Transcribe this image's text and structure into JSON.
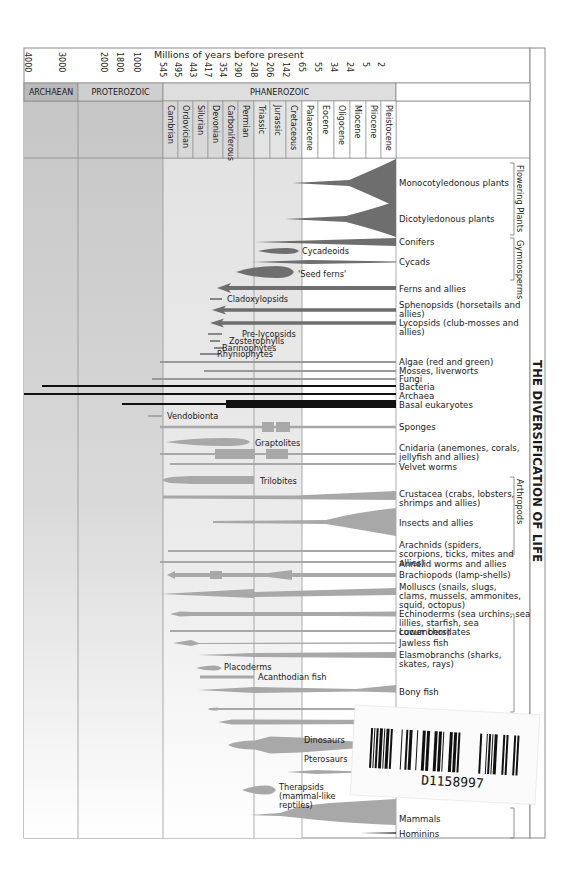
{
  "title": "THE DIVERSIFICATION OF LIFE",
  "axis": {
    "label": "Millions of years before present",
    "ticks": [
      {
        "label": "4000",
        "x": 28
      },
      {
        "label": "3000",
        "x": 62
      },
      {
        "label": "2000",
        "x": 104
      },
      {
        "label": "1800",
        "x": 120
      },
      {
        "label": "1000",
        "x": 137
      },
      {
        "label": "545",
        "x": 163
      },
      {
        "label": "495",
        "x": 178
      },
      {
        "label": "443",
        "x": 193
      },
      {
        "label": "417",
        "x": 208
      },
      {
        "label": "354",
        "x": 223
      },
      {
        "label": "290",
        "x": 238
      },
      {
        "label": "248",
        "x": 254
      },
      {
        "label": "206",
        "x": 270
      },
      {
        "label": "142",
        "x": 286
      },
      {
        "label": "65",
        "x": 302
      },
      {
        "label": "55",
        "x": 318
      },
      {
        "label": "34",
        "x": 334
      },
      {
        "label": "24",
        "x": 350
      },
      {
        "label": "5",
        "x": 366
      },
      {
        "label": "2",
        "x": 381
      }
    ]
  },
  "eras": [
    {
      "label": "ARCHAEAN",
      "x0": 24,
      "x1": 78,
      "fill": "#b9b9b9"
    },
    {
      "label": "PROTEROZOIC",
      "x0": 78,
      "x1": 163,
      "fill": "#cfcfcf"
    },
    {
      "label": "PHANEROZOIC",
      "x0": 163,
      "x1": 396,
      "fill": "#dedede"
    }
  ],
  "periods": [
    {
      "label": "Cambrian",
      "x0": 163,
      "x1": 178,
      "fill": "#d8d8d8"
    },
    {
      "label": "Ordovician",
      "x0": 178,
      "x1": 193,
      "fill": "#d8d8d8"
    },
    {
      "label": "Silurian",
      "x0": 193,
      "x1": 208,
      "fill": "#d8d8d8"
    },
    {
      "label": "Devonian",
      "x0": 208,
      "x1": 223,
      "fill": "#d8d8d8"
    },
    {
      "label": "Carboniferous",
      "x0": 223,
      "x1": 238,
      "fill": "#d8d8d8"
    },
    {
      "label": "Permian",
      "x0": 238,
      "x1": 254,
      "fill": "#d8d8d8"
    },
    {
      "label": "Triassic",
      "x0": 254,
      "x1": 270,
      "fill": "#e4e4e4"
    },
    {
      "label": "Jurassic",
      "x0": 270,
      "x1": 286,
      "fill": "#e4e4e4"
    },
    {
      "label": "Cretaceous",
      "x0": 286,
      "x1": 302,
      "fill": "#e4e4e4"
    },
    {
      "label": "Palaeocene",
      "x0": 302,
      "x1": 318,
      "fill": "#ffffff"
    },
    {
      "label": "Eocene",
      "x0": 318,
      "x1": 334,
      "fill": "#ffffff"
    },
    {
      "label": "Oligocene",
      "x0": 334,
      "x1": 350,
      "fill": "#ffffff"
    },
    {
      "label": "Miocene",
      "x0": 350,
      "x1": 366,
      "fill": "#ffffff"
    },
    {
      "label": "Pliocene",
      "x0": 366,
      "x1": 381,
      "fill": "#ffffff"
    },
    {
      "label": "Pleistocene",
      "x0": 381,
      "x1": 396,
      "fill": "#ffffff"
    }
  ],
  "groups": [
    {
      "label": "Flowering Plants",
      "y0": 163,
      "y1": 235
    },
    {
      "label": "Gymnosperms",
      "y0": 238,
      "y1": 280
    },
    {
      "label": "Arthropods",
      "y0": 477,
      "y1": 555
    },
    {
      "label": "",
      "y0": 614,
      "y1": 712
    },
    {
      "label": "",
      "y0": 808,
      "y1": 838
    }
  ],
  "lineages": [
    {
      "label": "Monocotyledonous plants",
      "ly": 183,
      "color": "#6e6e6e",
      "shape": "flare",
      "x0": 292,
      "x1": 396,
      "y": 183,
      "w": 48
    },
    {
      "label": "Dicotyledonous plants",
      "ly": 219,
      "color": "#6e6e6e",
      "shape": "flare",
      "x0": 285,
      "x1": 396,
      "y": 219,
      "w": 36
    },
    {
      "label": "Conifers",
      "ly": 242,
      "color": "#6e6e6e",
      "shape": "wedge",
      "x0": 255,
      "x1": 396,
      "y": 242,
      "w": 8
    },
    {
      "label": "Cycadeoids",
      "ly": 251,
      "color": "#6e6e6e",
      "shape": "spindle",
      "x0": 258,
      "x1": 299,
      "y": 251,
      "w": 6,
      "inline": true
    },
    {
      "label": "Cycads",
      "ly": 262,
      "color": "#6e6e6e",
      "shape": "taper",
      "x0": 252,
      "x1": 396,
      "y": 262,
      "w": 4
    },
    {
      "label": "'Seed ferns'",
      "ly": 274,
      "color": "#6e6e6e",
      "shape": "spindle",
      "x0": 236,
      "x1": 294,
      "y": 272,
      "w": 12,
      "inline": true
    },
    {
      "label": "Ferns and allies",
      "ly": 289,
      "color": "#6e6e6e",
      "shape": "arrowbar",
      "x0": 217,
      "x1": 396,
      "y": 288,
      "w": 8
    },
    {
      "label": "Cladoxylopsids",
      "ly": 299,
      "color": "#888888",
      "shape": "bar",
      "x0": 210,
      "x1": 222,
      "y": 299,
      "w": 2,
      "inline": true
    },
    {
      "label": "Sphenopsids (horsetails and allies)",
      "ly": 305,
      "color": "#6e6e6e",
      "shape": "arrowbar",
      "x0": 212,
      "x1": 396,
      "y": 310,
      "w": 7
    },
    {
      "label": "Lycopsids (club-mosses and allies)",
      "ly": 323,
      "color": "#6e6e6e",
      "shape": "arrowbar",
      "x0": 210,
      "x1": 396,
      "y": 323,
      "w": 7
    },
    {
      "label": "Pre-lycopsids",
      "ly": 334,
      "color": "#888888",
      "shape": "bar",
      "x0": 208,
      "x1": 222,
      "y": 334,
      "w": 2,
      "inline": true
    },
    {
      "label": "Zosterophylls",
      "ly": 341,
      "color": "#888888",
      "shape": "bar",
      "x0": 210,
      "x1": 220,
      "y": 341,
      "w": 2,
      "inline": true
    },
    {
      "label": "Barinophytes",
      "ly": 348,
      "color": "#888888",
      "shape": "bar",
      "x0": 214,
      "x1": 224,
      "y": 348,
      "w": 2,
      "inline": true
    },
    {
      "label": "Rhyniophytes",
      "ly": 354,
      "color": "#888888",
      "shape": "bar",
      "x0": 200,
      "x1": 220,
      "y": 354,
      "w": 2,
      "inline": true
    },
    {
      "label": "Algae (red and green)",
      "ly": 362,
      "color": "#9a9a9a",
      "shape": "bar",
      "x0": 160,
      "x1": 396,
      "y": 362,
      "w": 2
    },
    {
      "label": "Mosses, liverworts",
      "ly": 371,
      "color": "#9a9a9a",
      "shape": "bar",
      "x0": 204,
      "x1": 396,
      "y": 371,
      "w": 2
    },
    {
      "label": "Fungi",
      "ly": 379,
      "color": "#9a9a9a",
      "shape": "bar",
      "x0": 152,
      "x1": 396,
      "y": 379,
      "w": 2
    },
    {
      "label": "Bacteria",
      "ly": 387,
      "color": "#111111",
      "shape": "bar",
      "x0": 42,
      "x1": 396,
      "y": 386,
      "w": 2
    },
    {
      "label": "Archaea",
      "ly": 396,
      "color": "#111111",
      "shape": "bar",
      "x0": 24,
      "x1": 396,
      "y": 394,
      "w": 2
    },
    {
      "label": "Basal eukaryotes",
      "ly": 405,
      "color": "#111111",
      "shape": "blockbar",
      "x0": 122,
      "x1": 396,
      "y": 404,
      "w": 8,
      "bx": 226
    },
    {
      "label": "Vendobionta",
      "ly": 416,
      "color": "#a8a8a8",
      "shape": "bar",
      "x0": 148,
      "x1": 162,
      "y": 416,
      "w": 2,
      "inline": true
    },
    {
      "label": "Sponges",
      "ly": 427,
      "color": "#a8a8a8",
      "shape": "sponge",
      "x0": 160,
      "x1": 396,
      "y": 427,
      "w": 5
    },
    {
      "label": "Graptolites",
      "ly": 443,
      "color": "#a8a8a8",
      "shape": "spindle",
      "x0": 166,
      "x1": 250,
      "y": 442,
      "w": 8,
      "inline": true
    },
    {
      "label": "Cnidaria (anemones, corals, jellyfish and allies)",
      "ly": 448,
      "color": "#a8a8a8",
      "shape": "cnidaria",
      "x0": 160,
      "x1": 396,
      "y": 454,
      "w": 4
    },
    {
      "label": "Velvet worms",
      "ly": 467,
      "color": "#a8a8a8",
      "shape": "bar",
      "x0": 170,
      "x1": 396,
      "y": 464,
      "w": 2
    },
    {
      "label": "Trilobites",
      "ly": 481,
      "color": "#a8a8a8",
      "shape": "trilobite",
      "x0": 162,
      "x1": 254,
      "y": 480,
      "w": 14,
      "inline": true
    },
    {
      "label": "Crustacea (crabs, lobsters, shrimps and allies)",
      "ly": 494,
      "color": "#a8a8a8",
      "shape": "taperup",
      "x0": 163,
      "x1": 396,
      "y": 497,
      "w": 6
    },
    {
      "label": "Insects and allies",
      "ly": 523,
      "color": "#a8a8a8",
      "shape": "insect",
      "x0": 213,
      "x1": 396,
      "y": 522,
      "w": 28
    },
    {
      "label": "Arachnids (spiders, scorpions, ticks, mites and allies)",
      "ly": 545,
      "color": "#a8a8a8",
      "shape": "bar",
      "x0": 168,
      "x1": 396,
      "y": 551,
      "w": 2
    },
    {
      "label": "Annelid worms and allies",
      "ly": 564,
      "color": "#a8a8a8",
      "shape": "bar",
      "x0": 160,
      "x1": 396,
      "y": 562,
      "w": 2
    },
    {
      "label": "Brachiopods (lamp-shells)",
      "ly": 575,
      "color": "#a8a8a8",
      "shape": "brachio",
      "x0": 167,
      "x1": 396,
      "y": 575,
      "w": 5
    },
    {
      "label": "Molluscs (snails, slugs, clams, mussels, ammonites, squid, octopus)",
      "ly": 587,
      "color": "#a8a8a8",
      "shape": "mollusc",
      "x0": 160,
      "x1": 396,
      "y": 594,
      "w": 8
    },
    {
      "label": "Echinoderms (sea urchins, sea lillies, starfish, sea cucumbers)",
      "ly": 614,
      "color": "#a8a8a8",
      "shape": "echino",
      "x0": 170,
      "x1": 396,
      "y": 614,
      "w": 10
    },
    {
      "label": "Lower chordates",
      "ly": 632,
      "color": "#a8a8a8",
      "shape": "bar",
      "x0": 170,
      "x1": 396,
      "y": 631,
      "w": 2
    },
    {
      "label": "Jawless fish",
      "ly": 643,
      "color": "#a8a8a8",
      "shape": "jawless",
      "x0": 173,
      "x1": 396,
      "y": 643,
      "w": 6
    },
    {
      "label": "Elasmobranchs (sharks, skates, rays)",
      "ly": 655,
      "color": "#a8a8a8",
      "shape": "elasmo",
      "x0": 198,
      "x1": 396,
      "y": 655,
      "w": 8
    },
    {
      "label": "Placoderms",
      "ly": 667,
      "color": "#a8a8a8",
      "shape": "spindle",
      "x0": 196,
      "x1": 222,
      "y": 668,
      "w": 5,
      "inline": true
    },
    {
      "label": "Acanthodian fish",
      "ly": 677,
      "color": "#a8a8a8",
      "shape": "bar",
      "x0": 200,
      "x1": 254,
      "y": 677,
      "w": 3,
      "inline": true
    },
    {
      "label": "Bony fish",
      "ly": 692,
      "color": "#a8a8a8",
      "shape": "bony",
      "x0": 198,
      "x1": 396,
      "y": 690,
      "w": 10
    },
    {
      "label": "",
      "ly": 709,
      "color": "#a8a8a8",
      "shape": "amphib",
      "x0": 208,
      "x1": 396,
      "y": 709,
      "w": 6
    },
    {
      "label": "",
      "ly": 723,
      "color": "#a8a8a8",
      "shape": "reptile",
      "x0": 218,
      "x1": 396,
      "y": 722,
      "w": 10
    },
    {
      "label": "Dinosaurs",
      "ly": 740,
      "color": "#a8a8a8",
      "shape": "dino",
      "x0": 228,
      "x1": 360,
      "y": 745,
      "w": 18,
      "inline": true
    },
    {
      "label": "Pterosaurs",
      "ly": 759,
      "color": "#a8a8a8",
      "shape": "none",
      "x0": 0,
      "x1": 0,
      "y": 0,
      "w": 0,
      "inline": true
    },
    {
      "label": "",
      "ly": 772,
      "color": "#a8a8a8",
      "shape": "taper",
      "x0": 287,
      "x1": 360,
      "y": 772,
      "w": 4
    },
    {
      "label": "Therapsids (mammal-like reptiles)",
      "ly": 787,
      "color": "#a8a8a8",
      "shape": "spindle",
      "x0": 242,
      "x1": 276,
      "y": 790,
      "w": 9,
      "inline": true
    },
    {
      "label": "Mammals",
      "ly": 819,
      "color": "#a8a8a8",
      "shape": "mammal",
      "x0": 250,
      "x1": 396,
      "y": 815,
      "w": 40
    },
    {
      "label": "Hominins",
      "ly": 834,
      "color": "#333333",
      "shape": "hominin",
      "x0": 360,
      "x1": 396,
      "y": 833,
      "w": 3
    }
  ],
  "sticker": {
    "code": "D1158997"
  }
}
